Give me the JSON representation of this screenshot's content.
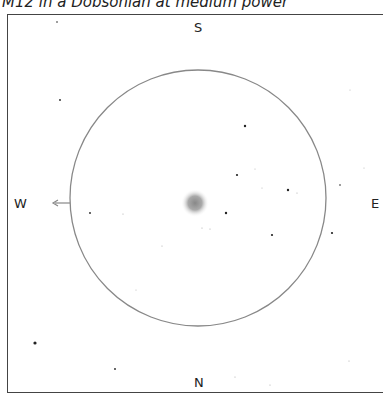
{
  "title": "M12 in a Dobsonian at medium power",
  "directions": {
    "south": "S",
    "north": "N",
    "west": "W",
    "east": "E"
  },
  "field": {
    "cx": 198,
    "cy": 198,
    "r": 128,
    "circle_color": "#888888"
  },
  "cluster": {
    "cx": 195,
    "cy": 203,
    "r": 14
  },
  "stars": [
    [
      57,
      22,
      0.8
    ],
    [
      60,
      100,
      0.9
    ],
    [
      245,
      126,
      1.2
    ],
    [
      237,
      175,
      1.1
    ],
    [
      288,
      190,
      1.2
    ],
    [
      297,
      193,
      0.6
    ],
    [
      226,
      213,
      1.2
    ],
    [
      272,
      235,
      1.1
    ],
    [
      332,
      233,
      1.1
    ],
    [
      340,
      185,
      0.8
    ],
    [
      90,
      213,
      0.9
    ],
    [
      123,
      214,
      0.6
    ],
    [
      162,
      246,
      0.6
    ],
    [
      202,
      228,
      0.6
    ],
    [
      210,
      229,
      0.6
    ],
    [
      35,
      343,
      1.6
    ],
    [
      115,
      369,
      0.9
    ],
    [
      235,
      377,
      0.6
    ],
    [
      270,
      385,
      0.6
    ],
    [
      349,
      361,
      0.6
    ],
    [
      350,
      90,
      0.5
    ],
    [
      262,
      188,
      0.5
    ],
    [
      255,
      169,
      0.5
    ],
    [
      136,
      290,
      0.5
    ],
    [
      364,
      168,
      0.5
    ]
  ]
}
